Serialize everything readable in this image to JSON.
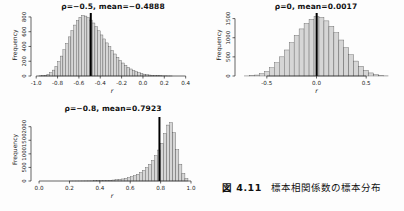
{
  "figure": {
    "caption_label": "図 4.11",
    "caption_text": "標本相関係数の標本分布"
  },
  "style": {
    "background": "#fdfdfd",
    "bar_fill": "#d6d6d6",
    "bar_stroke": "#474747",
    "axis_color": "#222222",
    "text_color": "#222222",
    "mean_line_color": "#000000"
  },
  "chart_data": [
    {
      "type": "bar",
      "subtype": "histogram",
      "title": "ρ=−0.5, mean=−0.4888",
      "rho": -0.5,
      "mean": -0.4888,
      "xlabel": "r",
      "ylabel": "Frequency",
      "xlim": [
        -1.03,
        0.45
      ],
      "ylim": [
        0,
        840
      ],
      "bin_start": -0.975,
      "bin_width": 0.025,
      "values": [
        2,
        5,
        10,
        22,
        45,
        80,
        130,
        195,
        270,
        355,
        440,
        530,
        615,
        690,
        750,
        795,
        820,
        812,
        790,
        758,
        718,
        668,
        612,
        556,
        502,
        448,
        396,
        346,
        298,
        252,
        212,
        176,
        145,
        118,
        95,
        75,
        58,
        45,
        34,
        25,
        18,
        13,
        9,
        6,
        4,
        3,
        2,
        2,
        1,
        1
      ],
      "xticks": [
        -1.0,
        -0.8,
        -0.6,
        -0.4,
        -0.2,
        0.0,
        0.2,
        0.4
      ],
      "xtick_labels": [
        "-1.0",
        "-0.8",
        "-0.6",
        "-0.4",
        "-0.2",
        "0.0",
        "0.2",
        "0.4"
      ],
      "yticks": [
        0,
        200,
        400,
        600,
        800
      ],
      "ytick_labels": [
        "0",
        "200",
        "400",
        "600",
        "800"
      ],
      "mean_line": -0.4888,
      "grid": false,
      "legend": null
    },
    {
      "type": "bar",
      "subtype": "histogram",
      "title": "ρ=0, mean=0.0017",
      "rho": 0,
      "mean": 0.0017,
      "xlabel": "r",
      "ylabel": "Frequency",
      "xlim": [
        -0.8,
        0.8
      ],
      "ylim": [
        0,
        1620
      ],
      "bin_start": -0.725,
      "bin_width": 0.05,
      "values": [
        2,
        8,
        25,
        60,
        120,
        215,
        345,
        500,
        680,
        870,
        1060,
        1230,
        1370,
        1480,
        1550,
        1530,
        1440,
        1300,
        1130,
        940,
        740,
        555,
        390,
        255,
        150,
        80,
        35,
        12,
        3
      ],
      "xticks": [
        -0.5,
        0.0,
        0.5
      ],
      "xtick_labels": [
        "-0.5",
        "0.0",
        "0.5"
      ],
      "yticks": [
        0,
        500,
        1000,
        1500
      ],
      "ytick_labels": [
        "0",
        "500",
        "1000",
        "1500"
      ],
      "mean_line": 0.0017,
      "grid": false,
      "legend": null
    },
    {
      "type": "bar",
      "subtype": "histogram",
      "title": "ρ=−0.8, mean=0.7923",
      "rho": -0.8,
      "mean": 0.7923,
      "xlabel": "r",
      "ylabel": "Frequency",
      "xlim": [
        -0.04,
        1.0
      ],
      "ylim": [
        0,
        2320
      ],
      "bin_start": 0.2,
      "bin_width": 0.02,
      "values": [
        1,
        1,
        2,
        2,
        3,
        4,
        5,
        6,
        8,
        10,
        13,
        17,
        22,
        28,
        36,
        46,
        59,
        75,
        96,
        122,
        155,
        196,
        248,
        312,
        392,
        490,
        610,
        755,
        930,
        1140,
        1390,
        1750,
        2060,
        2150,
        1780,
        1150,
        620,
        280,
        90
      ],
      "xticks": [
        0.0,
        0.2,
        0.4,
        0.6,
        0.8,
        1.0
      ],
      "xtick_labels": [
        "0.0",
        "0.2",
        "0.4",
        "0.6",
        "0.8",
        "1.0"
      ],
      "yticks": [
        0,
        500,
        1000,
        1500,
        2000
      ],
      "ytick_labels": [
        "0",
        "500",
        "1000",
        "1500",
        "2000"
      ],
      "mean_line": 0.7923,
      "grid": false,
      "legend": null
    }
  ]
}
